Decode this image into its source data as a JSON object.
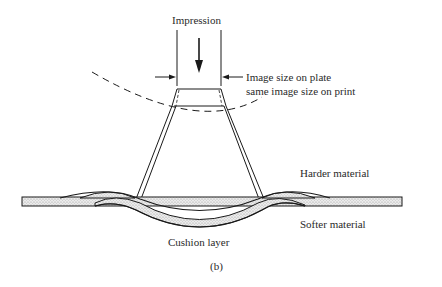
{
  "diagram": {
    "title_label": "Impression",
    "image_size_line1": "Image size on plate",
    "image_size_line2": "same image size on print",
    "harder_material": "Harder material",
    "softer_material": "Softer material",
    "cushion_layer": "Cushion layer",
    "caption": "(b)",
    "colors": {
      "line": "#1a1a1a",
      "fill_stipple": "#d8d8d8",
      "text": "#2a2a2a"
    },
    "icons": {
      "impression_arrow": "arrow-down-icon",
      "left_marker_arrow": "arrow-right-icon",
      "right_marker_arrow": "arrow-left-icon"
    }
  }
}
